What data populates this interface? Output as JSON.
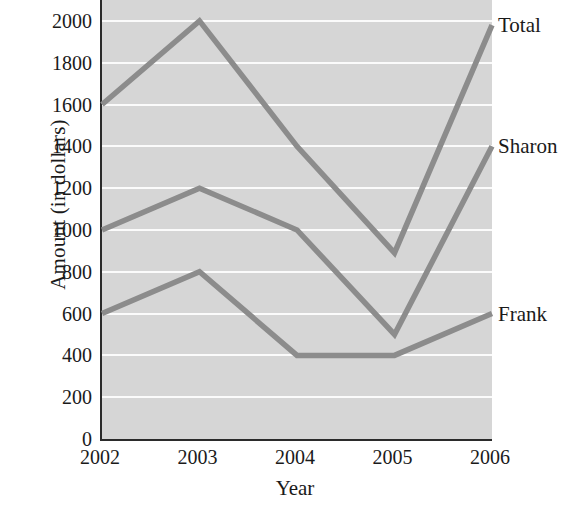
{
  "chart_data": {
    "type": "line",
    "title": "",
    "xlabel": "Year",
    "ylabel": "Amount (in dollars)",
    "categories": [
      "2002",
      "2003",
      "2004",
      "2005",
      "2006"
    ],
    "x": [
      2002,
      2003,
      2004,
      2005,
      2006
    ],
    "xlim": [
      2002,
      2006
    ],
    "ylim": [
      0,
      2100
    ],
    "y_ticks": [
      0,
      200,
      400,
      600,
      800,
      1000,
      1200,
      1400,
      1600,
      1800,
      2000
    ],
    "y_tick_labels": [
      "0",
      "200",
      "400",
      "600",
      "800",
      "1000",
      "1200",
      "1400",
      "1600",
      "1800",
      "2000"
    ],
    "grid": "horizontal",
    "grid_color": "#fbfbfb",
    "plot_background": "#d6d6d6",
    "legend_position": "right-inline-end-labels",
    "series": [
      {
        "name": "Total",
        "label": "Total",
        "color": "#8c8c8c",
        "values": [
          1600,
          2000,
          1400,
          890,
          1980
        ]
      },
      {
        "name": "Sharon",
        "label": "Sharon",
        "color": "#8c8c8c",
        "values": [
          1000,
          1200,
          1000,
          500,
          1400
        ]
      },
      {
        "name": "Frank",
        "label": "Frank",
        "color": "#8c8c8c",
        "values": [
          600,
          800,
          400,
          400,
          600
        ]
      }
    ]
  }
}
